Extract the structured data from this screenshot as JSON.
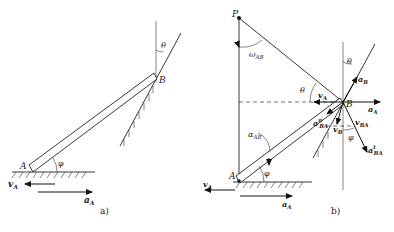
{
  "figure": {
    "panel_a": {
      "caption": "a)",
      "labels": {
        "A": "A",
        "B": "B",
        "theta": "θ",
        "phi": "φ",
        "vA": "v",
        "vA_sub": "A",
        "aA": "a",
        "aA_sub": "A"
      }
    },
    "panel_b": {
      "caption": "b)",
      "labels": {
        "P": "P",
        "A": "A",
        "B": "B",
        "omega": "ω",
        "omega_sub": "AB",
        "alpha": "α",
        "alpha_sub": "AB",
        "theta_top": "θ",
        "theta_mid": "θ",
        "phi_bottom": "φ",
        "phi_right": "φ",
        "vA_top": "v",
        "vA_top_sub": "A",
        "vA_bottom": "v",
        "vA_bottom_sub": "A",
        "aA_right": "a",
        "aA_right_sub": "A",
        "aA_bottom": "a",
        "aA_bottom_sub": "A",
        "aB": "a",
        "aB_sub": "B",
        "vB": "v",
        "vB_sub": "B",
        "vBA": "v",
        "vBA_sub": "BA",
        "aBAn": "a",
        "aBAn_sub": "BA",
        "aBAn_sup": "n",
        "aBAt": "a",
        "aBAt_sub": "BA",
        "aBAt_sup": "t"
      }
    }
  }
}
